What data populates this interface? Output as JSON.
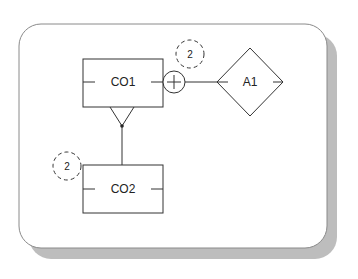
{
  "diagram": {
    "type": "entity-relationship",
    "colors": {
      "background": "#ffffff",
      "stroke": "#333333",
      "frame_stroke": "#8a8a8a",
      "shadow": "#bdbdbd"
    },
    "entities": [
      {
        "id": "CO1",
        "label": "CO1",
        "shape": "rectangle"
      },
      {
        "id": "CO2",
        "label": "CO2",
        "shape": "rectangle"
      }
    ],
    "relationships": [
      {
        "id": "A1",
        "label": "A1",
        "shape": "diamond"
      }
    ],
    "connectors": [
      {
        "from": "CO1",
        "to": "A1",
        "symbol": "plus-circle"
      },
      {
        "from": "CO1",
        "to": "CO2",
        "symbol": "subtype-triangle"
      }
    ],
    "badges": [
      {
        "label": "2",
        "near": "CO1-A1 connector",
        "style": "dashed-circle"
      },
      {
        "label": "2",
        "near": "CO2",
        "style": "dashed-circle"
      }
    ]
  }
}
